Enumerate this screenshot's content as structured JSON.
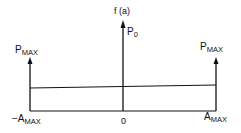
{
  "diagram": {
    "type": "probability-density",
    "y_axis_label": "f (a)",
    "center_impulse_label": "P",
    "center_impulse_sub": "0",
    "left_impulse_label": "P",
    "left_impulse_sub": "MAX",
    "right_impulse_label": "P",
    "right_impulse_sub": "MAX",
    "x_tick_left": "−A",
    "x_tick_left_sub": "MAX",
    "x_tick_center": "0",
    "x_tick_right": "A",
    "x_tick_right_sub": "MAX",
    "line_color": "#111111"
  }
}
